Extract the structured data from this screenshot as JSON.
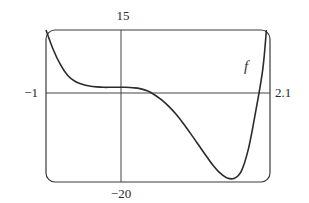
{
  "chart_data": {
    "type": "line",
    "title": "",
    "xlabel": "",
    "ylabel": "",
    "xlim": [
      -1,
      2.1
    ],
    "ylim": [
      -20,
      15
    ],
    "grid": false,
    "tick_labels": {
      "x_min": "−1",
      "x_max": "2.1",
      "y_max": "15",
      "y_min": "−20"
    },
    "series": [
      {
        "name": "f",
        "x": [
          -1.0,
          -0.9,
          -0.8,
          -0.7,
          -0.6,
          -0.5,
          -0.4,
          -0.3,
          -0.2,
          -0.1,
          0.0,
          0.1,
          0.2,
          0.3,
          0.4,
          0.5,
          0.6,
          0.7,
          0.8,
          0.9,
          1.0,
          1.1,
          1.2,
          1.3,
          1.4,
          1.5,
          1.6,
          1.7,
          1.8,
          1.9,
          2.0,
          2.05
        ],
        "values": [
          15.0,
          10.5,
          7.0,
          4.5,
          3.2,
          2.5,
          2.1,
          1.9,
          1.8,
          1.8,
          1.8,
          1.8,
          1.7,
          1.5,
          1.0,
          0.1,
          -1.1,
          -2.6,
          -4.4,
          -6.5,
          -8.8,
          -11.2,
          -13.6,
          -15.9,
          -17.8,
          -19.0,
          -19.2,
          -17.6,
          -12.5,
          -4.0,
          6.0,
          15.0
        ]
      }
    ],
    "annotations": [
      {
        "text": "f",
        "x": 1.75,
        "y": 6.5
      }
    ]
  }
}
